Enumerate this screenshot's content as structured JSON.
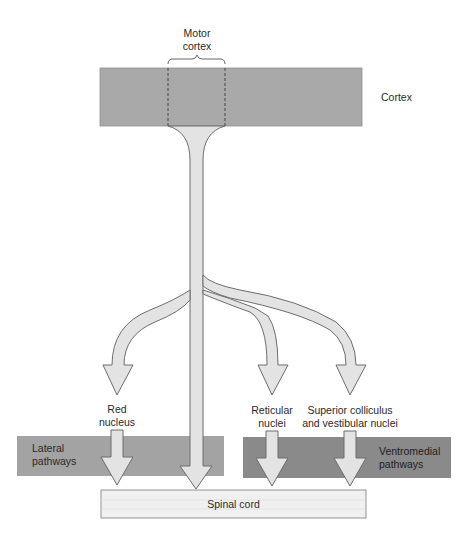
{
  "labels": {
    "motor_cortex_line1": "Motor",
    "motor_cortex_line2": "cortex",
    "cortex": "Cortex",
    "red_nucleus_line1": "Red",
    "red_nucleus_line2": "nucleus",
    "reticular_line1": "Reticular",
    "reticular_line2": "nuclei",
    "superior_line1": "Superior colliculus",
    "superior_line2": "and vestibular nuclei",
    "lateral_line1": "Lateral",
    "lateral_line2": "pathways",
    "ventromedial_line1": "Ventromedial",
    "ventromedial_line2": "pathways",
    "spinal_cord": "Spinal cord"
  },
  "colors": {
    "cortex_fill": "#a9a9a9",
    "lateral_fill": "#a3a3a3",
    "ventromedial_fill": "#8a8a8a",
    "arrow_fill": "#e3e3e3",
    "arrow_stroke": "#6d6d6d",
    "spinal_fill": "#f0f0f0"
  }
}
